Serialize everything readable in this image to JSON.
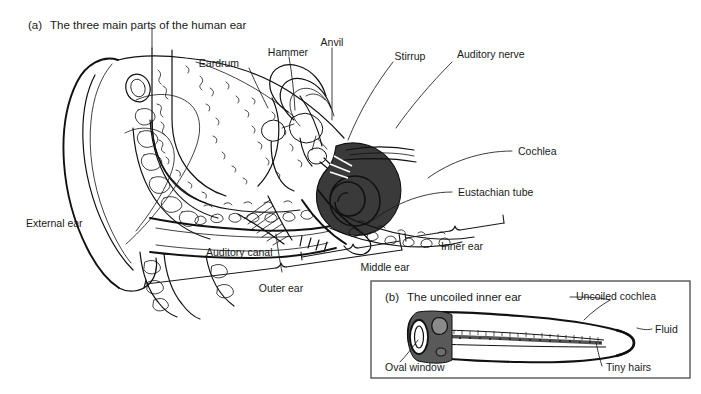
{
  "figure": {
    "background_color": "#ffffff",
    "ink_color": "#111111",
    "cochlea_fill": "#3a3a3a",
    "inset_border_color": "#555555"
  },
  "panel_a": {
    "marker": "(a)",
    "title": "The three main parts of the human ear",
    "labels": {
      "eardrum": "Eardrum",
      "hammer": "Hammer",
      "anvil": "Anvil",
      "stirrup": "Stirrup",
      "auditory_nerve": "Auditory nerve",
      "cochlea": "Cochlea",
      "eustachian_tube": "Eustachian tube",
      "external_ear": "External ear",
      "auditory_canal": "Auditory canal",
      "outer_ear": "Outer ear",
      "middle_ear": "Middle ear",
      "inner_ear": "Inner ear"
    }
  },
  "panel_b": {
    "marker": "(b)",
    "title": "The uncoiled inner ear",
    "labels": {
      "uncoiled_cochlea": "Uncoiled cochlea",
      "fluid": "Fluid",
      "tiny_hairs": "Tiny hairs",
      "oval_window": "Oval window"
    }
  }
}
